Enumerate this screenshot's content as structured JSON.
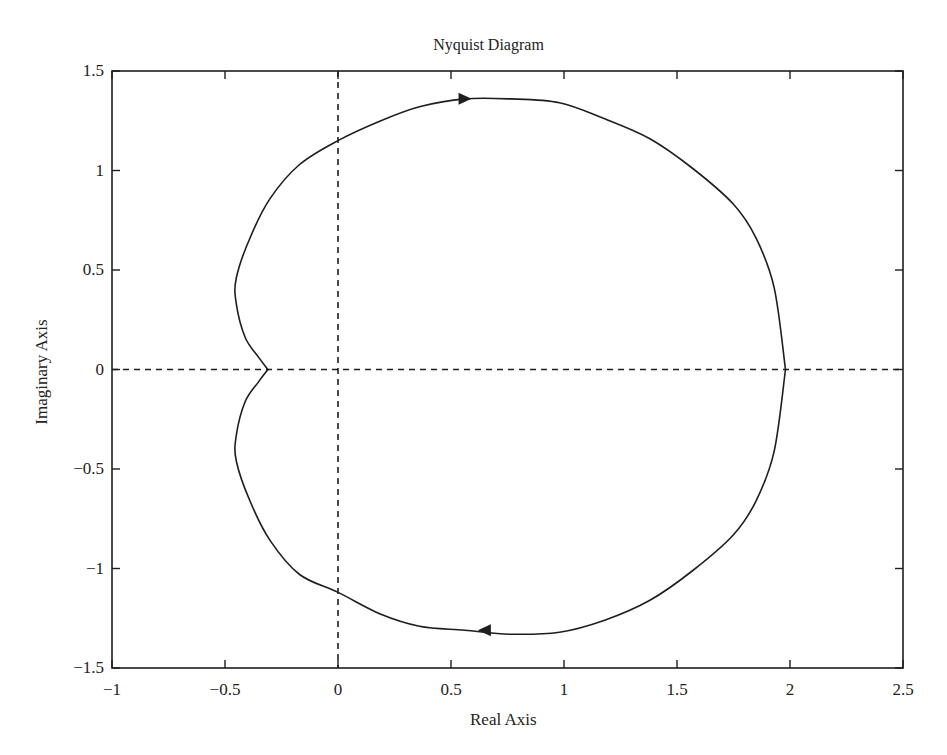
{
  "chart_data": {
    "type": "line",
    "title": "Nyquist Diagram",
    "xlabel": "Real Axis",
    "ylabel": "Imaginary Axis",
    "xlim": [
      -1,
      2.5
    ],
    "ylim": [
      -1.5,
      1.5
    ],
    "xticks": [
      -1,
      -0.5,
      0,
      0.5,
      1,
      1.5,
      2,
      2.5
    ],
    "xtick_labels": [
      "−1",
      "−0.5",
      "0",
      "0.5",
      "1",
      "1.5",
      "2",
      "2.5"
    ],
    "yticks": [
      1.5,
      1,
      0.5,
      0,
      -0.5,
      -1,
      -1.5
    ],
    "ytick_labels": [
      "1.5",
      "1",
      "0.5",
      "0",
      "−0.5",
      "−1",
      "−1.5"
    ],
    "grid": false,
    "legend": null,
    "reference_lines": [
      {
        "orientation": "horizontal",
        "value": 0,
        "style": "dashed"
      },
      {
        "orientation": "vertical",
        "value": 0,
        "style": "dashed"
      }
    ],
    "series": [
      {
        "name": "Nyquist curve (positive frequency, upper half)",
        "x": [
          1.98,
          1.93,
          1.85,
          1.75,
          1.57,
          1.38,
          1.18,
          0.98,
          0.76,
          0.56,
          0.36,
          0.19,
          0.0,
          -0.17,
          -0.3,
          -0.39,
          -0.45,
          -0.45,
          -0.41,
          -0.35,
          -0.31
        ],
        "y": [
          0.0,
          0.41,
          0.66,
          0.83,
          1.01,
          1.16,
          1.26,
          1.34,
          1.36,
          1.36,
          1.32,
          1.25,
          1.15,
          1.03,
          0.86,
          0.66,
          0.46,
          0.33,
          0.16,
          0.06,
          0.0
        ]
      },
      {
        "name": "Nyquist curve (negative frequency, lower half)",
        "x": [
          -0.31,
          -0.35,
          -0.41,
          -0.45,
          -0.45,
          -0.39,
          -0.3,
          -0.17,
          0.0,
          0.19,
          0.36,
          0.56,
          0.76,
          0.98,
          1.18,
          1.38,
          1.57,
          1.75,
          1.85,
          1.93,
          1.98
        ],
        "y": [
          0.0,
          -0.06,
          -0.16,
          -0.33,
          -0.46,
          -0.66,
          -0.86,
          -1.03,
          -1.12,
          -1.23,
          -1.29,
          -1.31,
          -1.33,
          -1.32,
          -1.26,
          -1.16,
          -1.01,
          -0.83,
          -0.66,
          -0.41,
          0.0
        ]
      }
    ],
    "annotations": [
      {
        "type": "arrow",
        "x": 0.56,
        "y": 1.36,
        "direction": "right"
      },
      {
        "type": "arrow",
        "x": 0.65,
        "y": -1.31,
        "direction": "left"
      }
    ],
    "key_points": {
      "positive_real_crossing": [
        1.98,
        0
      ],
      "negative_real_crossing": [
        -0.31,
        0
      ],
      "imag_axis_crossing_upper": [
        0,
        1.15
      ],
      "imag_axis_crossing_lower": [
        0,
        -1.12
      ]
    }
  },
  "style": {
    "line_color": "#1e1e1e",
    "axis_color": "#1e1e1e",
    "background": "#ffffff"
  }
}
